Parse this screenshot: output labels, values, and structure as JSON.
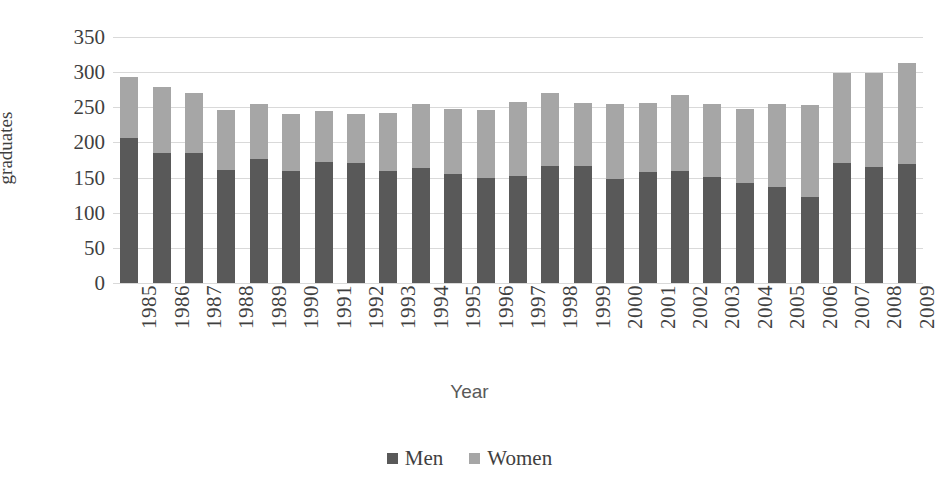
{
  "chart_data": {
    "type": "bar",
    "subtype": "stacked-bar",
    "title": "",
    "xlabel": "Year",
    "ylabel": "graduates",
    "ylim": [
      0,
      350
    ],
    "ytick_step": 50,
    "yticks": [
      350,
      300,
      250,
      200,
      150,
      100,
      50,
      0
    ],
    "grid": true,
    "legend_position": "bottom-center",
    "categories": [
      "1985",
      "1986",
      "1987",
      "1988",
      "1989",
      "1990",
      "1991",
      "1992",
      "1993",
      "1994",
      "1995",
      "1996",
      "1997",
      "1998",
      "1999",
      "2000",
      "2001",
      "2002",
      "2003",
      "2004",
      "2005",
      "2006",
      "2007",
      "2008",
      "2009"
    ],
    "series": [
      {
        "name": "Men",
        "color": "#595959",
        "values": [
          207,
          185,
          185,
          161,
          176,
          160,
          172,
          171,
          159,
          164,
          155,
          149,
          152,
          167,
          166,
          148,
          158,
          160,
          151,
          143,
          137,
          122,
          171,
          165,
          170
        ]
      },
      {
        "name": "Women",
        "color": "#a6a6a6",
        "values": [
          86,
          94,
          86,
          85,
          79,
          81,
          73,
          70,
          83,
          90,
          92,
          97,
          106,
          104,
          90,
          107,
          98,
          107,
          104,
          105,
          118,
          132,
          128,
          134,
          143
        ]
      }
    ],
    "totals": [
      293,
      279,
      271,
      246,
      255,
      241,
      245,
      241,
      242,
      254,
      247,
      246,
      258,
      271,
      256,
      255,
      256,
      267,
      255,
      248,
      255,
      254,
      299,
      299,
      313
    ]
  },
  "axes": {
    "y_title": "graduates",
    "x_title": "Year"
  },
  "legend": {
    "items": [
      {
        "label": "Men",
        "color": "#595959",
        "swatch": "square-swatch"
      },
      {
        "label": "Women",
        "color": "#a6a6a6",
        "swatch": "square-swatch"
      }
    ]
  }
}
